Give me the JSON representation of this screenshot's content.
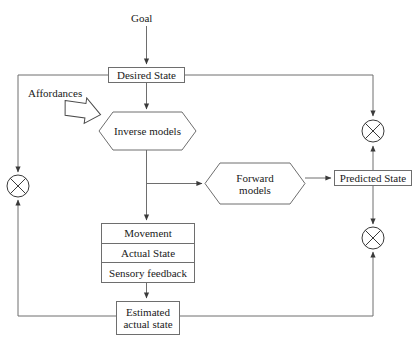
{
  "diagram": {
    "stroke_color": "#6e6e6e",
    "text_color": "#1a1a1a",
    "background": "#ffffff",
    "nodes": {
      "goal": {
        "label": "Goal",
        "shape": "text"
      },
      "desired_state": {
        "label": "Desired State",
        "shape": "rect"
      },
      "affordances": {
        "label": "Affordances",
        "shape": "text"
      },
      "inverse_models": {
        "label": "Inverse models",
        "shape": "hexagon"
      },
      "forward_models": {
        "label_line1": "Forward",
        "label_line2": "models",
        "shape": "hexagon"
      },
      "predicted_state": {
        "label": "Predicted State",
        "shape": "rect"
      },
      "movement": {
        "label": "Movement",
        "shape": "rect"
      },
      "actual_state": {
        "label": "Actual State",
        "shape": "rect"
      },
      "sensory_feedback": {
        "label": "Sensory feedback",
        "shape": "rect"
      },
      "estimated_actual_state": {
        "label_line1": "Estimated",
        "label_line2": "actual state",
        "shape": "rect"
      }
    },
    "junctions": [
      {
        "name": "comparator-left",
        "symbol": "circle-with-x"
      },
      {
        "name": "comparator-upper-right",
        "symbol": "circle-with-x"
      },
      {
        "name": "comparator-lower-right",
        "symbol": "circle-with-x"
      }
    ],
    "arrows": [
      {
        "from": "goal",
        "to": "desired_state"
      },
      {
        "from": "desired_state",
        "to": "inverse_models"
      },
      {
        "from": "desired_state",
        "to": "comparator-upper-right"
      },
      {
        "from": "desired_state",
        "to": "comparator-left"
      },
      {
        "from": "affordances",
        "to": "inverse_models",
        "style": "block-arrow"
      },
      {
        "from": "inverse_models",
        "to": "forward_models"
      },
      {
        "from": "inverse_models",
        "to": "movement"
      },
      {
        "from": "forward_models",
        "to": "predicted_state"
      },
      {
        "from": "predicted_state",
        "to": "comparator-upper-right"
      },
      {
        "from": "predicted_state",
        "to": "comparator-lower-right"
      },
      {
        "from": "sensory_feedback",
        "to": "estimated_actual_state"
      },
      {
        "from": "estimated_actual_state",
        "to": "comparator-left"
      },
      {
        "from": "estimated_actual_state",
        "to": "comparator-lower-right"
      }
    ]
  }
}
